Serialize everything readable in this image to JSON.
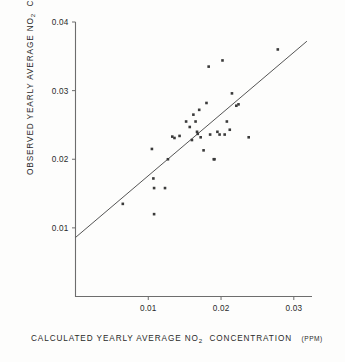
{
  "chart_data": {
    "type": "scatter",
    "title": "",
    "xlabel": "CALCULATED YEARLY AVERAGE NO2 CONCENTRATION (PPM)",
    "ylabel": "OBSERVED YEARLY AVERAGE NO2 CONCENTRATION (PPM)",
    "xlim": [
      0.0,
      0.0325
    ],
    "ylim": [
      0.0,
      0.04
    ],
    "xticks": [
      0.01,
      0.02,
      0.03
    ],
    "yticks": [
      0.01,
      0.02,
      0.03,
      0.04
    ],
    "xtick_labels": [
      "0.01",
      "0.02",
      "0.03"
    ],
    "ytick_labels": [
      "0.01",
      "0.02",
      "0.03",
      "0.04"
    ],
    "grid": false,
    "legend": "none",
    "units": "PPM",
    "series": [
      {
        "name": "stations",
        "marker": "square",
        "points": [
          [
            0.0065,
            0.0135
          ],
          [
            0.0105,
            0.0215
          ],
          [
            0.0107,
            0.0172
          ],
          [
            0.0108,
            0.0158
          ],
          [
            0.0108,
            0.012
          ],
          [
            0.0123,
            0.0158
          ],
          [
            0.0127,
            0.02
          ],
          [
            0.0133,
            0.0233
          ],
          [
            0.0136,
            0.0231
          ],
          [
            0.0143,
            0.0234
          ],
          [
            0.0152,
            0.0255
          ],
          [
            0.0157,
            0.0247
          ],
          [
            0.016,
            0.0228
          ],
          [
            0.0162,
            0.0265
          ],
          [
            0.0165,
            0.0255
          ],
          [
            0.0167,
            0.024
          ],
          [
            0.0168,
            0.0237
          ],
          [
            0.017,
            0.0272
          ],
          [
            0.0172,
            0.0232
          ],
          [
            0.0176,
            0.0213
          ],
          [
            0.018,
            0.0282
          ],
          [
            0.0183,
            0.0335
          ],
          [
            0.0185,
            0.0236
          ],
          [
            0.019,
            0.02
          ],
          [
            0.0191,
            0.02
          ],
          [
            0.0195,
            0.024
          ],
          [
            0.0198,
            0.0236
          ],
          [
            0.0202,
            0.0344
          ],
          [
            0.0205,
            0.0236
          ],
          [
            0.0208,
            0.0255
          ],
          [
            0.0212,
            0.0243
          ],
          [
            0.0215,
            0.0296
          ],
          [
            0.0221,
            0.0278
          ],
          [
            0.0224,
            0.028
          ],
          [
            0.0238,
            0.0232
          ],
          [
            0.0278,
            0.036
          ]
        ]
      }
    ],
    "fit_line": {
      "name": "regression line",
      "x_start": 0.0,
      "y_start": 0.0086,
      "x_end": 0.0318,
      "y_end": 0.0372
    }
  },
  "axes": {
    "y_title_main": "OBSERVED YEARLY AVERAGE NO",
    "y_title_sub": "2",
    "y_title_tail": "CONCENTRATION",
    "y_title_units": "(PPM)",
    "x_title_main": "CALCULATED YEARLY AVERAGE NO",
    "x_title_sub": "2",
    "x_title_tail": "CONCENTRATION",
    "x_title_units": "(PPM)"
  }
}
